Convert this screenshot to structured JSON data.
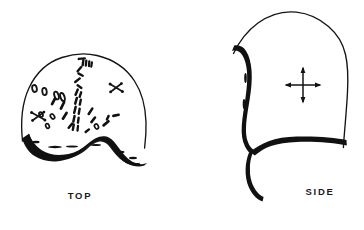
{
  "figure": {
    "type": "hand-drawn-line-illustration",
    "background_color": "#ffffff",
    "ink_color": "#111111",
    "views": [
      {
        "id": "top",
        "caption": "TOP",
        "caption_position": {
          "x": 80,
          "y": 199
        },
        "description": "dome-shaped crown with thick dark band along the lower edge",
        "outline": {
          "left_x": 21,
          "right_x": 146,
          "apex_y": 56,
          "base_y": 150
        },
        "band": {
          "name": "thick-band",
          "style": "heavy solid brush stroke",
          "shape": "arches upward at center and dips at both sides"
        },
        "marks": {
          "oval_count": 8,
          "dash_count": 10,
          "cross_count": 2,
          "seam_description": "wavy vertical chain of short dashes down the centre"
        }
      },
      {
        "id": "side",
        "caption": "SIDE",
        "caption_position": {
          "x": 320,
          "y": 195
        },
        "description": "hood profile with heavy band down the left edge, along the bottom, and a hanging tail",
        "outline": {
          "left_x": 232,
          "right_x": 348,
          "top_y": 13,
          "base_y": 148
        },
        "band": {
          "name": "thick-band",
          "style": "heavy solid brush stroke",
          "shape": "runs from upper-left down the front edge, turns right along the bottom, with a curved tail dropping below"
        },
        "marks": {
          "arrow_cross": {
            "name": "grain-direction-marker",
            "center": {
              "x": 303,
              "y": 85
            },
            "arms": 4,
            "description": "four-headed arrow indicating stretch or grain direction"
          }
        }
      }
    ]
  },
  "captions": {
    "top": "TOP",
    "side": "SIDE"
  }
}
